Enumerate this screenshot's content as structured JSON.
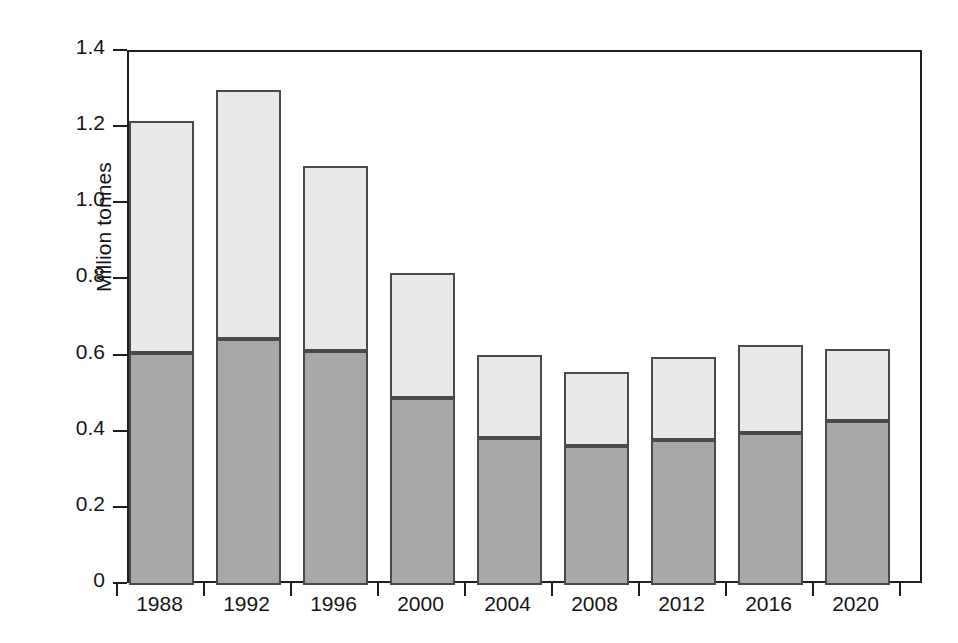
{
  "chart_data": {
    "type": "bar",
    "subtype": "stacked-vertical",
    "title": "",
    "xlabel": "",
    "ylabel": "Million tonnes",
    "categories": [
      "1988",
      "1992",
      "1996",
      "2000",
      "2004",
      "2008",
      "2012",
      "2016",
      "2020"
    ],
    "series": [
      {
        "name": "lower-segment",
        "color": "#a8a8a8",
        "values": [
          0.61,
          0.645,
          0.615,
          0.49,
          0.385,
          0.365,
          0.38,
          0.4,
          0.43
        ]
      },
      {
        "name": "upper-segment",
        "color": "#e8e8e8",
        "values": [
          0.61,
          0.655,
          0.485,
          0.33,
          0.22,
          0.195,
          0.22,
          0.23,
          0.19
        ]
      }
    ],
    "totals": [
      1.22,
      1.3,
      1.1,
      0.82,
      0.605,
      0.56,
      0.6,
      0.63,
      0.62
    ],
    "ylim": [
      0,
      1.4
    ],
    "yticks": [
      "0",
      "0.2",
      "0.4",
      "0.6",
      "0.8",
      "1.0",
      "1.2",
      "1.4"
    ],
    "ytick_values": [
      0,
      0.2,
      0.4,
      0.6,
      0.8,
      1.0,
      1.2,
      1.4
    ],
    "grid": false,
    "legend": "none",
    "frame": "box"
  },
  "axis": {
    "y_label": "Million tonnes"
  }
}
